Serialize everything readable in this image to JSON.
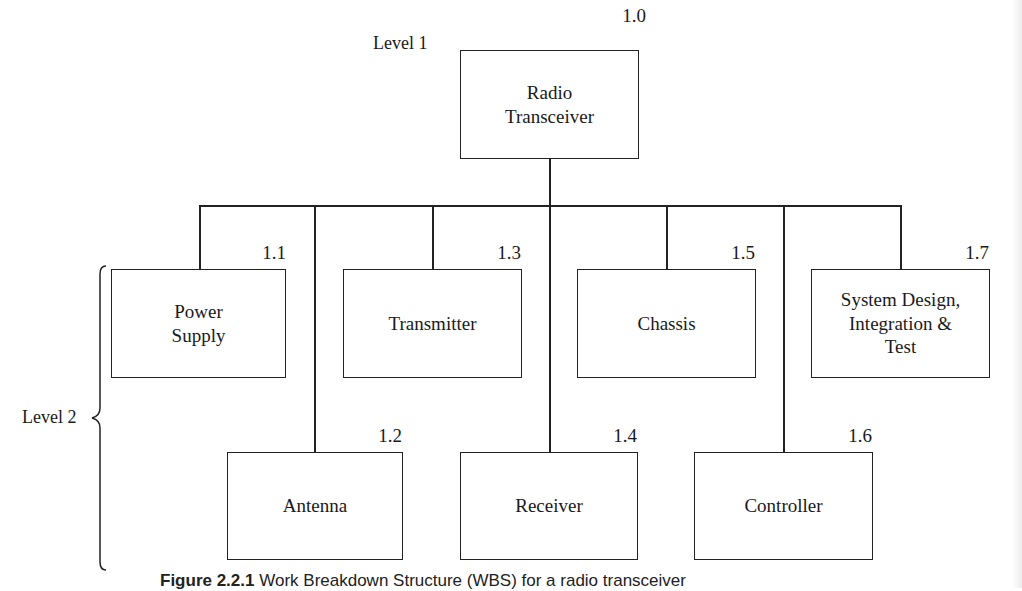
{
  "diagram": {
    "type": "work-breakdown-structure",
    "levels": {
      "level1_label": "Level 1",
      "level2_label": "Level 2"
    },
    "root": {
      "id": "1.0",
      "label": "Radio\nTransceiver"
    },
    "children": [
      {
        "id": "1.1",
        "label": "Power\nSupply"
      },
      {
        "id": "1.2",
        "label": "Antenna"
      },
      {
        "id": "1.3",
        "label": "Transmitter"
      },
      {
        "id": "1.4",
        "label": "Receiver"
      },
      {
        "id": "1.5",
        "label": "Chassis"
      },
      {
        "id": "1.6",
        "label": "Controller"
      },
      {
        "id": "1.7",
        "label": "System Design,\nIntegration &\nTest"
      }
    ],
    "caption": {
      "figure_label": "Figure 2.2.1",
      "text": "Work Breakdown Structure (WBS) for a radio transceiver"
    }
  }
}
